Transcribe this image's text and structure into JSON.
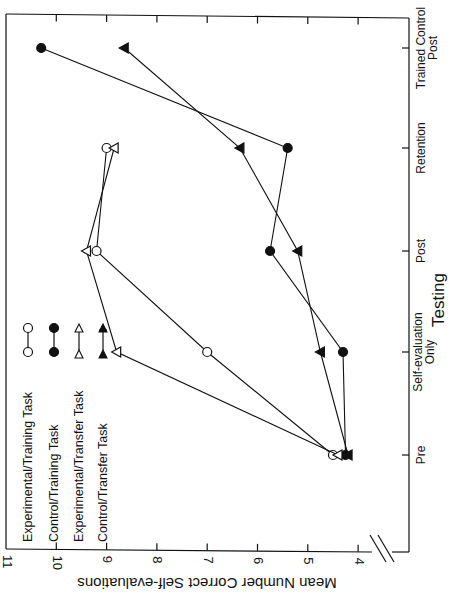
{
  "chart_data": {
    "type": "line",
    "orientation_note": "figure is printed rotated 90 degrees counter-clockwise",
    "title": "",
    "xlabel": "Testing",
    "ylabel": "Mean Number Correct Self-evaluations",
    "categories": [
      "Pre",
      "Self-evaluation Only",
      "Post",
      "Retention",
      "Trained Control Post"
    ],
    "category_lines": [
      [
        "Pre"
      ],
      [
        "Self-evaluation",
        "Only"
      ],
      [
        "Post"
      ],
      [
        "Retention"
      ],
      [
        "Trained Control",
        "Post"
      ]
    ],
    "yticks": [
      11,
      10,
      9,
      8,
      7,
      6,
      5,
      4
    ],
    "ylim": [
      4,
      11
    ],
    "axis_break": true,
    "grid": false,
    "legend_position": "inside, upper-left of plot (rotated)",
    "series": [
      {
        "name": "Experimental/Training Task",
        "marker": "open-circle",
        "values": [
          4.5,
          7.0,
          9.2,
          9.0,
          null
        ]
      },
      {
        "name": "Control/Training Task",
        "marker": "filled-circle",
        "values": [
          4.25,
          4.3,
          5.75,
          5.4,
          10.3
        ]
      },
      {
        "name": "Experimental/Transfer Task",
        "marker": "open-triangle",
        "values": [
          4.4,
          8.8,
          9.4,
          8.85,
          null
        ]
      },
      {
        "name": "Control/Transfer Task",
        "marker": "filled-triangle",
        "values": [
          4.2,
          4.75,
          5.2,
          6.35,
          8.65
        ]
      }
    ]
  },
  "labels": {
    "ylabel": "Mean Number Correct Self-evaluations",
    "xlabel": "Testing",
    "ticks": [
      "11",
      "10",
      "9",
      "8",
      "7",
      "6",
      "5",
      "4"
    ],
    "cat_pre": "Pre",
    "cat_self1": "Self-evaluation",
    "cat_self2": "Only",
    "cat_post": "Post",
    "cat_ret": "Retention",
    "cat_tcp1": "Trained Control",
    "cat_tcp2": "Post",
    "legend": [
      "Experimental/Training Task",
      "Control/Training Task",
      "Experimental/Transfer Task",
      "Control/Transfer Task"
    ]
  },
  "colors": {
    "ink": "#111111",
    "background": "#ffffff"
  }
}
